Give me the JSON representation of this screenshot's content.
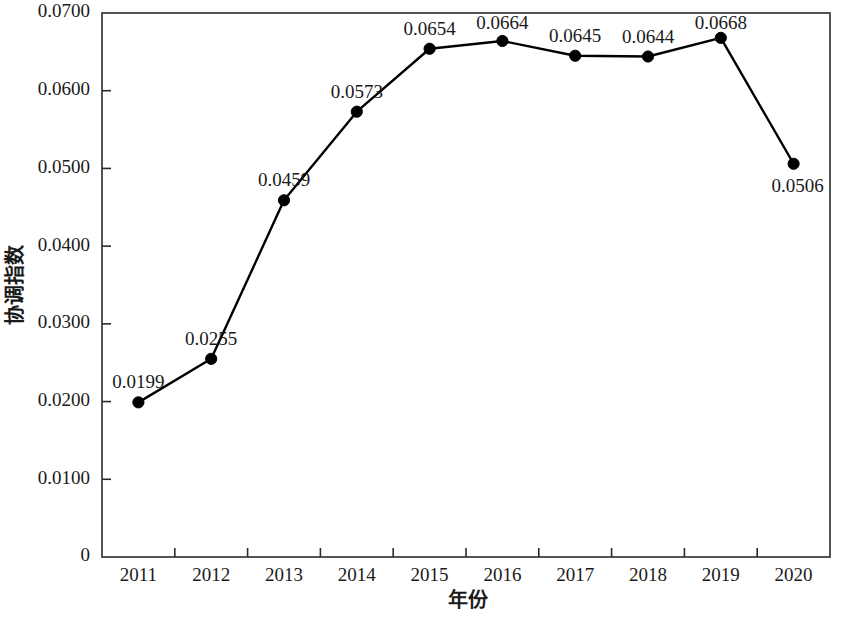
{
  "chart_data": {
    "type": "line",
    "title": "",
    "xlabel": "年份",
    "ylabel": "协调指数",
    "categories": [
      "2011",
      "2012",
      "2013",
      "2014",
      "2015",
      "2016",
      "2017",
      "2018",
      "2019",
      "2020"
    ],
    "values": [
      0.0199,
      0.0255,
      0.0459,
      0.0573,
      0.0654,
      0.0664,
      0.0645,
      0.0644,
      0.0668,
      0.0506
    ],
    "point_labels": [
      "0.0199",
      "0.0255",
      "0.0459",
      "0.0573",
      "0.0654",
      "0.0664",
      "0.0645",
      "0.0644",
      "0.0668",
      "0.0506"
    ],
    "series": [
      {
        "name": "协调指数",
        "values": [
          0.0199,
          0.0255,
          0.0459,
          0.0573,
          0.0654,
          0.0664,
          0.0645,
          0.0644,
          0.0668,
          0.0506
        ]
      }
    ],
    "ylim": [
      0,
      0.07
    ],
    "ytick_values": [
      0,
      0.01,
      0.02,
      0.03,
      0.04,
      0.05,
      0.06,
      0.07
    ],
    "ytick_labels": [
      "0",
      "0.0100",
      "0.0200",
      "0.0300",
      "0.0400",
      "0.0500",
      "0.0600",
      "0.0700"
    ],
    "grid": false,
    "legend": false,
    "legend_position": "none",
    "marker": "filled-circle",
    "line_color": "#000000",
    "marker_color": "#000000",
    "axis_color": "#2b2b2b",
    "background_color": "#ffffff",
    "label_placement": [
      "above",
      "above",
      "above",
      "above",
      "above",
      "above",
      "above",
      "above",
      "above",
      "below-right"
    ]
  },
  "axis": {
    "y_title": "协调指数",
    "x_title": "年份"
  },
  "ticks": {
    "y": [
      {
        "label": "0.0700",
        "value": 0.07
      },
      {
        "label": "0.0600",
        "value": 0.06
      },
      {
        "label": "0.0500",
        "value": 0.05
      },
      {
        "label": "0.0400",
        "value": 0.04
      },
      {
        "label": "0.0300",
        "value": 0.03
      },
      {
        "label": "0.0200",
        "value": 0.02
      },
      {
        "label": "0.0100",
        "value": 0.01
      },
      {
        "label": "0",
        "value": 0
      }
    ],
    "x": [
      {
        "label": "2011"
      },
      {
        "label": "2012"
      },
      {
        "label": "2013"
      },
      {
        "label": "2014"
      },
      {
        "label": "2015"
      },
      {
        "label": "2016"
      },
      {
        "label": "2017"
      },
      {
        "label": "2018"
      },
      {
        "label": "2019"
      },
      {
        "label": "2020"
      }
    ]
  },
  "points": [
    {
      "year": "2011",
      "value": "0.0199"
    },
    {
      "year": "2012",
      "value": "0.0255"
    },
    {
      "year": "2013",
      "value": "0.0459"
    },
    {
      "year": "2014",
      "value": "0.0573"
    },
    {
      "year": "2015",
      "value": "0.0654"
    },
    {
      "year": "2016",
      "value": "0.0664"
    },
    {
      "year": "2017",
      "value": "0.0645"
    },
    {
      "year": "2018",
      "value": "0.0644"
    },
    {
      "year": "2019",
      "value": "0.0668"
    },
    {
      "year": "2020",
      "value": "0.0506"
    }
  ]
}
